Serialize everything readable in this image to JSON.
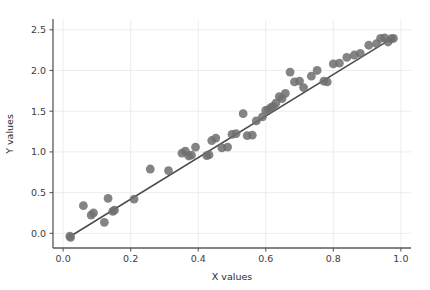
{
  "chart_data": {
    "type": "scatter",
    "title": "",
    "xlabel": "X values",
    "ylabel": "Y values",
    "xlim": [
      -0.03,
      1.03
    ],
    "ylim": [
      -0.18,
      2.62
    ],
    "xticks": [
      0.0,
      0.2,
      0.4,
      0.6,
      0.8,
      1.0
    ],
    "xtick_labels": [
      "0.0",
      "0.2",
      "0.4",
      "0.6",
      "0.8",
      "1.0"
    ],
    "yticks": [
      0.0,
      0.5,
      1.0,
      1.5,
      2.0,
      2.5
    ],
    "ytick_labels": [
      "0.0",
      "0.5",
      "1.0",
      "1.5",
      "2.0",
      "2.5"
    ],
    "grid": true,
    "legend": "none",
    "marker_color": "#6e6e6e",
    "marker_size": 4.4,
    "marker_opacity": 0.85,
    "line_color": "#4a4a4a",
    "line_width": 1.5,
    "grid_color": "#e8e8ec",
    "background_color": "#ffffff",
    "series": [
      {
        "name": "observations",
        "type": "scatter",
        "x": [
          0.02,
          0.022,
          0.06,
          0.083,
          0.09,
          0.122,
          0.133,
          0.147,
          0.152,
          0.21,
          0.258,
          0.312,
          0.352,
          0.362,
          0.372,
          0.38,
          0.392,
          0.425,
          0.432,
          0.44,
          0.452,
          0.47,
          0.487,
          0.5,
          0.512,
          0.533,
          0.545,
          0.56,
          0.572,
          0.59,
          0.6,
          0.608,
          0.615,
          0.622,
          0.63,
          0.64,
          0.648,
          0.658,
          0.672,
          0.685,
          0.7,
          0.712,
          0.735,
          0.752,
          0.772,
          0.782,
          0.8,
          0.818,
          0.84,
          0.862,
          0.88,
          0.905,
          0.928,
          0.94,
          0.952,
          0.962,
          0.972,
          0.978
        ],
        "y": [
          -0.035,
          -0.05,
          0.34,
          0.225,
          0.25,
          0.135,
          0.43,
          0.27,
          0.285,
          0.42,
          0.79,
          0.77,
          0.985,
          1.01,
          0.95,
          0.96,
          1.06,
          0.955,
          0.965,
          1.14,
          1.17,
          1.05,
          1.06,
          1.215,
          1.225,
          1.47,
          1.2,
          1.205,
          1.38,
          1.43,
          1.51,
          1.52,
          1.545,
          1.56,
          1.6,
          1.68,
          1.655,
          1.72,
          1.98,
          1.86,
          1.87,
          1.79,
          1.93,
          2.0,
          1.87,
          1.86,
          2.08,
          2.09,
          2.16,
          2.19,
          2.21,
          2.31,
          2.33,
          2.395,
          2.4,
          2.35,
          2.39,
          2.395
        ]
      },
      {
        "name": "fit-line",
        "type": "line",
        "x": [
          0.018,
          0.982
        ],
        "y": [
          -0.045,
          2.415
        ]
      }
    ]
  }
}
